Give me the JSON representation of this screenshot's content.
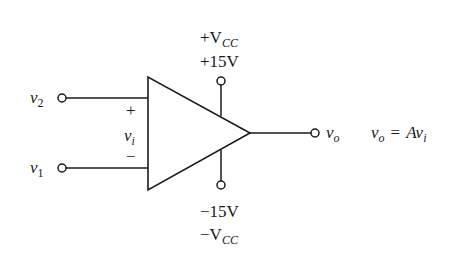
{
  "diagram": {
    "type": "op-amp-symbol",
    "colors": {
      "stroke": "#1a1a1a",
      "background": "#ffffff"
    },
    "inputs": {
      "noninverting": {
        "label_main": "v",
        "label_sub": "2",
        "sign": "+"
      },
      "inverting": {
        "label_main": "v",
        "label_sub": "1",
        "sign": "−"
      }
    },
    "differential_input": {
      "label_main": "v",
      "label_sub": "i"
    },
    "output": {
      "label_main": "v",
      "label_sub": "o"
    },
    "equation": {
      "lhs_main": "v",
      "lhs_sub": "o",
      "eq": "=",
      "rhs_a": "A",
      "rhs_main": "v",
      "rhs_sub": "i"
    },
    "supply_positive": {
      "name_prefix": "+V",
      "name_sub": "CC",
      "value": "+15V"
    },
    "supply_negative": {
      "name_prefix": "−V",
      "name_sub": "CC",
      "value": "−15V"
    }
  }
}
